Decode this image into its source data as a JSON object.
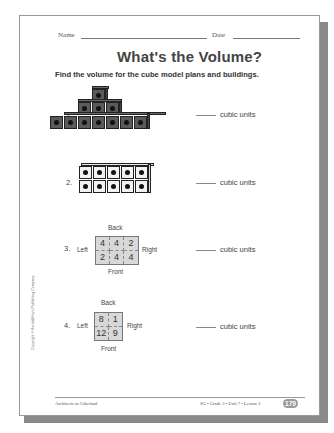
{
  "header": {
    "name_label": "Name",
    "date_label": "Date"
  },
  "title": "What's the Volume?",
  "instructions": "Find the volume for the cube model plans and buildings.",
  "problems": [
    {
      "number": "1.",
      "type": "cube-building",
      "answer_label": "cubic units",
      "layers": [
        7,
        3,
        1
      ]
    },
    {
      "number": "2.",
      "type": "cube-building",
      "answer_label": "cubic units",
      "rows": 2,
      "columns": 5
    },
    {
      "number": "3.",
      "type": "cube-model-plan",
      "answer_label": "cubic units",
      "labels": {
        "back": "Back",
        "front": "Front",
        "left": "Left",
        "right": "Right"
      },
      "grid": [
        [
          "4",
          "4",
          "2"
        ],
        [
          "2",
          "4",
          "4"
        ]
      ]
    },
    {
      "number": "4.",
      "type": "cube-model-plan",
      "answer_label": "cubic units",
      "labels": {
        "back": "Back",
        "front": "Front",
        "left": "Left",
        "right": "Right"
      },
      "grid": [
        [
          "8",
          "1"
        ],
        [
          "12",
          "9"
        ]
      ]
    }
  ],
  "footer": {
    "left": "Architects in Cubeland",
    "right": "SG • Grade 3 • Unit 7 • Lesson 3",
    "page_number": "179"
  },
  "copyright": "Copyright © Kendall/Hunt Publishing Company",
  "colors": {
    "dark_cube": "#5a5a5a",
    "light_cube": "#f2f2f2",
    "plan_fill": "#d8d8d8",
    "page_shadow": "#8a8a8a"
  }
}
